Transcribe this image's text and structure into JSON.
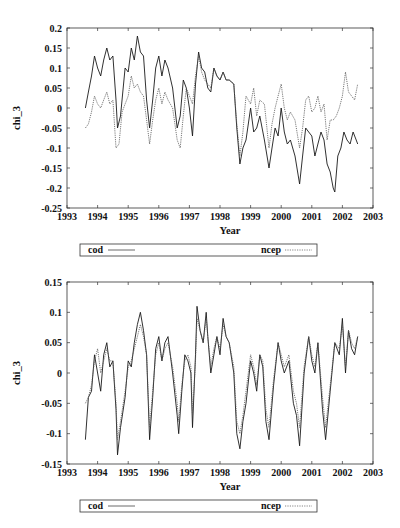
{
  "chart_data": [
    {
      "type": "line",
      "title": "",
      "xlabel": "Year",
      "ylabel": "chi_3",
      "xlim": [
        1993,
        2003
      ],
      "ylim": [
        -0.25,
        0.2
      ],
      "xticks": [
        1993,
        1994,
        1995,
        1996,
        1997,
        1998,
        1999,
        2000,
        2001,
        2002,
        2003
      ],
      "yticks": [
        -0.25,
        -0.2,
        -0.15,
        -0.1,
        -0.05,
        0,
        0.05,
        0.1,
        0.15,
        0.2
      ],
      "ytick_labels": [
        "-0.25",
        "-0.2",
        "-0.15",
        "-0.1",
        "-0.05",
        "0",
        "0.05",
        "0.1",
        "0.15",
        "0.2"
      ],
      "grid": false,
      "legend_position": "below",
      "series": [
        {
          "name": "cod",
          "style": "solid",
          "x": [
            1993.6,
            1993.7,
            1993.8,
            1993.9,
            1994.0,
            1994.1,
            1994.2,
            1994.3,
            1994.4,
            1994.5,
            1994.6,
            1994.65,
            1994.75,
            1994.9,
            1995.0,
            1995.1,
            1995.2,
            1995.3,
            1995.4,
            1995.5,
            1995.6,
            1995.7,
            1995.8,
            1995.9,
            1996.0,
            1996.1,
            1996.2,
            1996.3,
            1996.45,
            1996.6,
            1996.7,
            1996.8,
            1996.9,
            1997.0,
            1997.1,
            1997.2,
            1997.3,
            1997.4,
            1997.5,
            1997.6,
            1997.7,
            1997.8,
            1997.9,
            1998.0,
            1998.1,
            1998.2,
            1998.3,
            1998.45,
            1998.55,
            1998.65,
            1998.75,
            1998.85,
            1999.0,
            1999.1,
            1999.2,
            1999.3,
            1999.45,
            1999.6,
            1999.7,
            1999.8,
            1999.9,
            2000.0,
            2000.1,
            2000.2,
            2000.3,
            2000.45,
            2000.6,
            2000.7,
            2000.8,
            2000.9,
            2001.0,
            2001.1,
            2001.2,
            2001.3,
            2001.4,
            2001.5,
            2001.6,
            2001.7,
            2001.75,
            2001.85,
            2001.95,
            2002.05,
            2002.15,
            2002.25,
            2002.35,
            2002.45,
            2002.5
          ],
          "values": [
            0.0,
            0.04,
            0.08,
            0.13,
            0.1,
            0.08,
            0.12,
            0.15,
            0.12,
            0.13,
            0.02,
            -0.05,
            -0.02,
            0.1,
            0.09,
            0.15,
            0.12,
            0.18,
            0.14,
            0.13,
            0.02,
            -0.05,
            0.02,
            0.1,
            0.13,
            0.08,
            0.12,
            0.1,
            0.05,
            -0.05,
            -0.02,
            0.07,
            0.05,
            0.0,
            -0.07,
            0.06,
            0.14,
            0.1,
            0.09,
            0.05,
            0.04,
            0.1,
            0.08,
            0.07,
            0.09,
            0.07,
            0.07,
            0.06,
            -0.05,
            -0.14,
            -0.1,
            -0.08,
            0.0,
            -0.06,
            -0.05,
            -0.02,
            -0.08,
            -0.15,
            -0.1,
            -0.05,
            -0.07,
            0.0,
            -0.06,
            -0.09,
            -0.08,
            -0.12,
            -0.19,
            -0.12,
            -0.05,
            -0.06,
            -0.07,
            -0.12,
            -0.09,
            -0.06,
            -0.08,
            -0.14,
            -0.16,
            -0.2,
            -0.21,
            -0.12,
            -0.1,
            -0.06,
            -0.08,
            -0.09,
            -0.06,
            -0.08,
            -0.09
          ]
        },
        {
          "name": "ncep",
          "style": "dotted",
          "x": [
            1993.6,
            1993.7,
            1993.8,
            1993.9,
            1994.0,
            1994.1,
            1994.2,
            1994.3,
            1994.4,
            1994.5,
            1994.6,
            1994.7,
            1994.8,
            1994.9,
            1995.0,
            1995.1,
            1995.2,
            1995.3,
            1995.4,
            1995.5,
            1995.6,
            1995.7,
            1995.8,
            1995.9,
            1996.0,
            1996.1,
            1996.2,
            1996.3,
            1996.45,
            1996.6,
            1996.7,
            1996.8,
            1996.9,
            1997.0,
            1997.1,
            1997.2,
            1997.3,
            1997.4,
            1997.5,
            1997.6,
            1997.7,
            1997.8,
            1997.9,
            1998.0,
            1998.1,
            1998.2,
            1998.3,
            1998.45,
            1998.55,
            1998.65,
            1998.75,
            1998.85,
            1999.0,
            1999.1,
            1999.2,
            1999.3,
            1999.45,
            1999.6,
            1999.7,
            1999.8,
            1999.9,
            2000.0,
            2000.1,
            2000.2,
            2000.3,
            2000.45,
            2000.6,
            2000.7,
            2000.8,
            2000.9,
            2001.0,
            2001.1,
            2001.2,
            2001.3,
            2001.4,
            2001.5,
            2001.6,
            2001.7,
            2001.8,
            2001.9,
            2002.0,
            2002.1,
            2002.2,
            2002.3,
            2002.4,
            2002.5
          ],
          "values": [
            -0.05,
            -0.04,
            -0.01,
            0.03,
            0.01,
            0.0,
            0.02,
            0.04,
            0.01,
            0.02,
            -0.1,
            -0.09,
            -0.01,
            0.01,
            0.03,
            0.08,
            0.05,
            0.06,
            0.04,
            0.03,
            -0.03,
            -0.09,
            -0.03,
            0.02,
            0.05,
            0.01,
            0.04,
            0.02,
            0.0,
            -0.08,
            -0.1,
            -0.02,
            0.05,
            0.03,
            0.01,
            0.08,
            0.13,
            0.09,
            0.07,
            0.06,
            0.05,
            0.1,
            0.08,
            0.07,
            0.09,
            0.07,
            0.07,
            0.06,
            -0.04,
            -0.12,
            -0.06,
            0.03,
            0.01,
            0.05,
            -0.02,
            0.02,
            0.01,
            -0.1,
            -0.04,
            0.0,
            0.03,
            0.06,
            0.0,
            -0.03,
            -0.01,
            -0.03,
            -0.1,
            -0.05,
            0.02,
            0.03,
            -0.01,
            0.0,
            0.03,
            -0.01,
            0.01,
            -0.08,
            -0.03,
            -0.03,
            -0.02,
            0.0,
            0.03,
            0.09,
            0.04,
            0.03,
            0.02,
            0.06
          ]
        }
      ]
    },
    {
      "type": "line",
      "title": "",
      "xlabel": "Year",
      "ylabel": "chi_3",
      "xlim": [
        1993,
        2003
      ],
      "ylim": [
        -0.15,
        0.15
      ],
      "xticks": [
        1993,
        1994,
        1995,
        1996,
        1997,
        1998,
        1999,
        2000,
        2001,
        2002,
        2003
      ],
      "yticks": [
        -0.15,
        -0.1,
        -0.05,
        0,
        0.05,
        0.1,
        0.15
      ],
      "ytick_labels": [
        "-0.15",
        "-0.1",
        "-0.05",
        "0",
        "0.05",
        "0.1",
        "0.15"
      ],
      "grid": false,
      "legend_position": "below",
      "series": [
        {
          "name": "cod",
          "style": "solid",
          "x": [
            1993.6,
            1993.7,
            1993.8,
            1993.9,
            1994.0,
            1994.1,
            1994.2,
            1994.3,
            1994.4,
            1994.5,
            1994.6,
            1994.65,
            1994.75,
            1994.9,
            1995.0,
            1995.1,
            1995.2,
            1995.3,
            1995.4,
            1995.5,
            1995.6,
            1995.7,
            1995.8,
            1995.9,
            1996.0,
            1996.1,
            1996.2,
            1996.3,
            1996.45,
            1996.6,
            1996.65,
            1996.75,
            1996.85,
            1996.95,
            1997.05,
            1997.1,
            1997.2,
            1997.25,
            1997.35,
            1997.45,
            1997.55,
            1997.6,
            1997.7,
            1997.8,
            1997.9,
            1998.0,
            1998.1,
            1998.2,
            1998.3,
            1998.45,
            1998.55,
            1998.65,
            1998.75,
            1998.85,
            1999.0,
            1999.1,
            1999.2,
            1999.3,
            1999.4,
            1999.5,
            1999.6,
            1999.75,
            1999.9,
            2000.0,
            2000.1,
            2000.25,
            2000.4,
            2000.5,
            2000.6,
            2000.75,
            2000.9,
            2001.0,
            2001.1,
            2001.2,
            2001.35,
            2001.45,
            2001.6,
            2001.75,
            2001.9,
            2002.0,
            2002.1,
            2002.2,
            2002.3,
            2002.4,
            2002.5
          ],
          "values": [
            -0.11,
            -0.04,
            -0.03,
            0.03,
            0.0,
            -0.03,
            0.03,
            0.05,
            0.01,
            0.02,
            -0.06,
            -0.135,
            -0.09,
            -0.04,
            0.02,
            0.01,
            0.05,
            0.08,
            0.1,
            0.07,
            0.03,
            -0.11,
            -0.04,
            0.04,
            0.06,
            0.02,
            0.05,
            0.06,
            0.0,
            -0.07,
            -0.1,
            -0.03,
            0.03,
            0.02,
            0.0,
            -0.09,
            0.03,
            0.11,
            0.07,
            0.05,
            0.1,
            0.06,
            0.0,
            0.03,
            0.06,
            0.03,
            0.09,
            0.06,
            0.05,
            0.0,
            -0.1,
            -0.125,
            -0.08,
            -0.05,
            0.02,
            0.0,
            -0.03,
            0.03,
            0.01,
            -0.08,
            -0.11,
            -0.02,
            0.05,
            0.02,
            0.0,
            0.02,
            -0.05,
            -0.07,
            -0.12,
            0.0,
            0.06,
            0.02,
            0.0,
            0.05,
            -0.06,
            -0.11,
            -0.03,
            0.05,
            0.03,
            0.09,
            0.0,
            0.07,
            0.04,
            0.03,
            0.06
          ]
        },
        {
          "name": "ncep",
          "style": "dotted",
          "x": [
            1993.6,
            1993.7,
            1993.8,
            1993.9,
            1994.0,
            1994.1,
            1994.2,
            1994.3,
            1994.4,
            1994.5,
            1994.6,
            1994.65,
            1994.75,
            1994.9,
            1995.0,
            1995.1,
            1995.2,
            1995.3,
            1995.4,
            1995.5,
            1995.6,
            1995.7,
            1995.8,
            1995.9,
            1996.0,
            1996.1,
            1996.2,
            1996.3,
            1996.45,
            1996.6,
            1996.65,
            1996.75,
            1996.85,
            1996.95,
            1997.05,
            1997.1,
            1997.2,
            1997.25,
            1997.35,
            1997.45,
            1997.55,
            1997.6,
            1997.7,
            1997.8,
            1997.9,
            1998.0,
            1998.1,
            1998.2,
            1998.3,
            1998.45,
            1998.55,
            1998.65,
            1998.75,
            1998.85,
            1999.0,
            1999.1,
            1999.2,
            1999.3,
            1999.4,
            1999.5,
            1999.6,
            1999.75,
            1999.9,
            2000.0,
            2000.1,
            2000.25,
            2000.4,
            2000.5,
            2000.6,
            2000.75,
            2000.9,
            2001.0,
            2001.1,
            2001.2,
            2001.35,
            2001.45,
            2001.6,
            2001.75,
            2001.9,
            2002.0,
            2002.1,
            2002.2,
            2002.3,
            2002.4,
            2002.5
          ],
          "values": [
            -0.05,
            -0.04,
            -0.02,
            0.02,
            0.04,
            0.0,
            0.02,
            0.04,
            0.02,
            0.02,
            -0.05,
            -0.11,
            -0.08,
            -0.03,
            0.01,
            0.02,
            0.04,
            0.06,
            0.08,
            0.06,
            0.03,
            -0.09,
            -0.03,
            0.03,
            0.05,
            0.02,
            0.04,
            0.05,
            0.01,
            -0.05,
            -0.08,
            -0.02,
            0.02,
            0.03,
            0.01,
            -0.07,
            0.02,
            0.09,
            0.07,
            0.05,
            0.09,
            0.06,
            0.01,
            0.04,
            0.06,
            0.04,
            0.08,
            0.06,
            0.05,
            0.01,
            -0.08,
            -0.1,
            -0.07,
            -0.03,
            0.03,
            0.01,
            -0.02,
            0.03,
            0.02,
            -0.06,
            -0.09,
            -0.01,
            0.05,
            0.03,
            0.01,
            0.03,
            -0.03,
            -0.05,
            -0.09,
            0.01,
            0.06,
            0.03,
            0.01,
            0.05,
            -0.04,
            -0.09,
            -0.02,
            0.05,
            0.04,
            0.08,
            0.01,
            0.07,
            0.05,
            0.04,
            0.06
          ]
        }
      ]
    }
  ],
  "charts": [
    {
      "ylabel": "chi_3",
      "xlabel": "Year",
      "xtick_labels": [
        "1993",
        "1994",
        "1995",
        "1996",
        "1997",
        "1998",
        "1999",
        "2000",
        "2001",
        "2002",
        "2003"
      ],
      "legend": [
        {
          "label": "cod",
          "style": "solid"
        },
        {
          "label": "ncep",
          "style": "dotted"
        }
      ]
    },
    {
      "ylabel": "chi_3",
      "xlabel": "Year",
      "xtick_labels": [
        "1993",
        "1994",
        "1995",
        "1996",
        "1997",
        "1998",
        "1999",
        "2000",
        "2001",
        "2002",
        "2003"
      ],
      "legend": [
        {
          "label": "cod",
          "style": "solid"
        },
        {
          "label": "ncep",
          "style": "dotted"
        }
      ]
    }
  ],
  "colors": {
    "line": "#1a1a1a",
    "frame": "#333333",
    "background": "#ffffff"
  }
}
